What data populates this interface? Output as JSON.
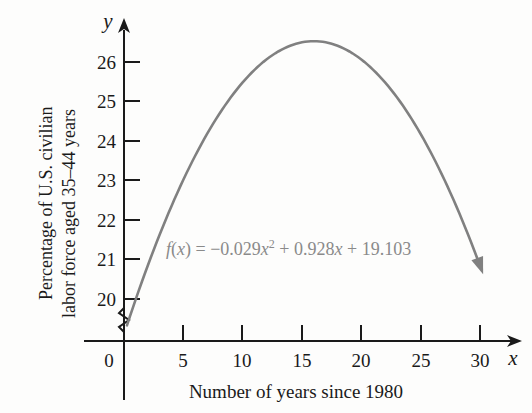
{
  "chart_data": {
    "type": "line",
    "title": "",
    "subtitle": "",
    "xlabel": "Number of years since 1980",
    "ylabel": "Percentage of U.S. civilian labor force aged 35–44 years",
    "ylabel_line1": "Percentage of U.S. civilian",
    "ylabel_line2": "labor force aged 35–44 years",
    "x_axis_variable": "x",
    "y_axis_variable": "y",
    "xlim": [
      0,
      30
    ],
    "ylim": [
      19.5,
      26.9
    ],
    "xticks": [
      "0",
      "5",
      "10",
      "15",
      "20",
      "25",
      "30"
    ],
    "xtick_values": [
      0,
      5,
      10,
      15,
      20,
      25,
      30
    ],
    "yticks": [
      "20",
      "21",
      "22",
      "23",
      "24",
      "25",
      "26"
    ],
    "ytick_values": [
      20,
      21,
      22,
      23,
      24,
      25,
      26
    ],
    "grid": false,
    "legend": null,
    "y_axis_break": true,
    "equation_label": "f(x) = −0.029x² + 0.928x + 19.103",
    "equation_parts": {
      "fname": "f",
      "open": "(",
      "arg": "x",
      "close": ")",
      "equals": " = −0.029",
      "var1": "x",
      "power": "2",
      "mid": " + 0.928",
      "var2": "x",
      "tail": " + 19.103"
    },
    "function": {
      "form": "quadratic",
      "a": -0.029,
      "b": 0.928,
      "c": 19.103,
      "vertex_x": 16,
      "vertex_y": 26.52
    },
    "series": [
      {
        "name": "f(x)",
        "color": "#808080",
        "x": [
          0,
          1,
          2,
          3,
          4,
          5,
          6,
          7,
          8,
          9,
          10,
          11,
          12,
          13,
          14,
          15,
          16,
          17,
          18,
          19,
          20,
          21,
          22,
          23,
          24,
          25,
          26,
          27,
          28,
          29,
          30
        ],
        "values": [
          19.1,
          20.0,
          20.8,
          21.6,
          22.4,
          23.0,
          23.6,
          24.2,
          24.7,
          25.1,
          25.5,
          25.8,
          26.1,
          26.3,
          26.4,
          26.5,
          26.5,
          26.5,
          26.4,
          26.3,
          26.1,
          25.8,
          25.5,
          25.1,
          24.7,
          24.2,
          23.6,
          23.0,
          22.4,
          21.6,
          20.8
        ]
      }
    ]
  }
}
